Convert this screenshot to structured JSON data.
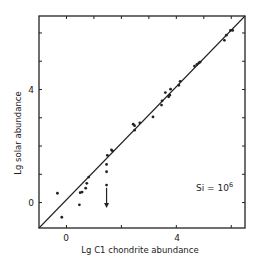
{
  "chart_data": {
    "type": "scatter",
    "title": "",
    "xlabel": "Lg C1 chondrite abundance",
    "ylabel": "Lg solar abundance",
    "xlim": [
      -1,
      6.5
    ],
    "ylim": [
      -0.9,
      6.6
    ],
    "grid": false,
    "legend": null,
    "x_ticks_labeled": [
      0,
      4
    ],
    "y_ticks_labeled": [
      0,
      4
    ],
    "x_ticks_bottom": [
      0,
      2,
      4,
      6
    ],
    "x_ticks_top": [
      0,
      1,
      2,
      3,
      4,
      5,
      6
    ],
    "y_ticks": [
      0,
      1,
      2,
      3,
      4,
      5,
      6
    ],
    "reference_line": {
      "label": "y = x",
      "from": [
        -1,
        -0.9
      ],
      "to": [
        6.5,
        6.6
      ]
    },
    "annotations": [
      {
        "text": "Si = 10",
        "superscript": "6",
        "x": 4.7,
        "y": 0.95
      }
    ],
    "upper_limit_arrow": {
      "x": 1.46,
      "y_from": 0.52,
      "y_to": -0.19
    },
    "series": [
      {
        "name": "elements",
        "points": [
          [
            -0.33,
            0.33
          ],
          [
            -0.17,
            -0.52
          ],
          [
            0.47,
            -0.08
          ],
          [
            0.5,
            0.35
          ],
          [
            0.57,
            0.37
          ],
          [
            0.7,
            0.51
          ],
          [
            0.74,
            0.68
          ],
          [
            0.81,
            0.9
          ],
          [
            1.46,
            0.62
          ],
          [
            1.46,
            1.09
          ],
          [
            1.46,
            1.35
          ],
          [
            1.49,
            1.67
          ],
          [
            1.64,
            1.86
          ],
          [
            1.68,
            1.82
          ],
          [
            2.43,
            2.77
          ],
          [
            2.48,
            2.72
          ],
          [
            2.48,
            2.56
          ],
          [
            2.67,
            2.82
          ],
          [
            3.15,
            3.03
          ],
          [
            3.46,
            3.45
          ],
          [
            3.48,
            3.6
          ],
          [
            3.6,
            3.89
          ],
          [
            3.72,
            3.74
          ],
          [
            3.76,
            3.8
          ],
          [
            3.79,
            4.01
          ],
          [
            4.09,
            4.15
          ],
          [
            4.14,
            4.29
          ],
          [
            4.66,
            4.83
          ],
          [
            4.75,
            4.89
          ],
          [
            4.82,
            4.94
          ],
          [
            4.87,
            4.97
          ],
          [
            5.75,
            5.74
          ],
          [
            5.82,
            5.92
          ],
          [
            5.97,
            6.09
          ],
          [
            6.05,
            6.09
          ]
        ]
      }
    ]
  },
  "labels": {
    "x_axis": "Lg C1 chondrite abundance",
    "y_axis": "Lg solar abundance",
    "x_tick_0": "0",
    "x_tick_4": "4",
    "y_tick_0": "0",
    "y_tick_4": "4",
    "annotation_main": "Si = 10",
    "annotation_sup": "6"
  },
  "colors": {
    "ink": "#222222",
    "background": "#ffffff"
  }
}
